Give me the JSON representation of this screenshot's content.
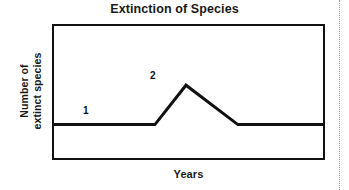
{
  "figure": {
    "background_color": "#ffffff",
    "title": "Extinction of Species",
    "page_edge_rule": {
      "name": "page-edge-dotted-rule",
      "color": "#9a9a9a",
      "style": "dotted"
    }
  },
  "axes": {
    "x_title": "Years",
    "y_title_line1": "Number of",
    "y_title_line2": "extinct species",
    "frame_color": "#111111",
    "frame_width_px": 2
  },
  "annotations": {
    "label_1": "1",
    "label_2": "2"
  },
  "chart_data": {
    "type": "line",
    "title": "Extinction of Species",
    "xlabel": "Years",
    "ylabel": "Number of extinct species",
    "grid": false,
    "legend": false,
    "axis_tick_labels": {
      "x": [],
      "y": []
    },
    "xlim": [
      0,
      100
    ],
    "ylim": [
      0,
      100
    ],
    "line_color": "#111111",
    "line_width_px": 3,
    "series": [
      {
        "name": "Number of extinct species over time",
        "x": [
          0,
          25.6,
          37.7,
          49.1,
          68.1,
          100
        ],
        "y": [
          26,
          26,
          26,
          55,
          26,
          26
        ]
      }
    ],
    "annotations": [
      {
        "label": "1",
        "x": 12,
        "y": 34,
        "describes": "low steady baseline rate of extinction"
      },
      {
        "label": "2",
        "x": 37.7,
        "y": 63,
        "describes": "peak - mass extinction event"
      }
    ]
  }
}
